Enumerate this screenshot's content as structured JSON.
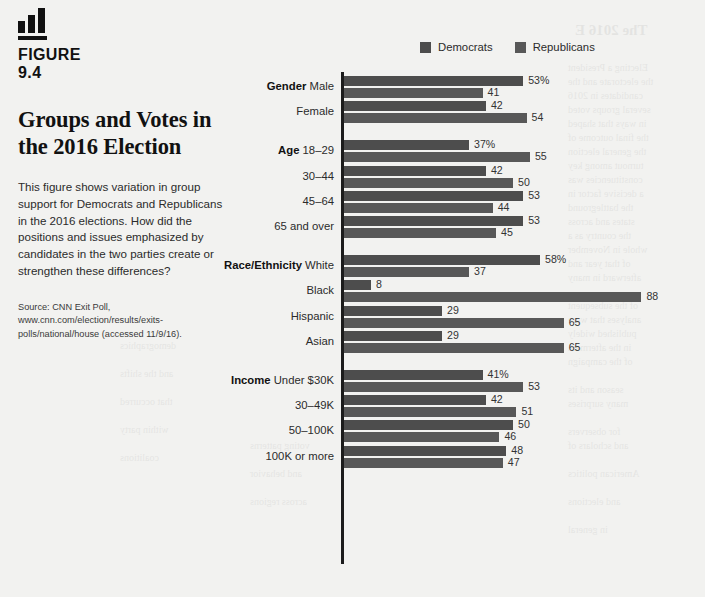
{
  "figure": {
    "icon_name": "bar-chart-icon",
    "label": "FIGURE\n9.4",
    "label_line1": "FIGURE",
    "label_line2": "9.4",
    "title": "Groups and Votes in the 2016 Election",
    "description": "This figure shows variation in group support for Democrats and Republicans in the 2016 elections. How did the positions and issues emphasized by candidates in the two parties create or strengthen these differences?",
    "source": "Source: CNN Exit Poll, www.cnn.com/election/results/exits-polls/national/house (accessed 11/9/16)."
  },
  "legend": {
    "position": "top-right",
    "items": [
      {
        "label": "Democrats",
        "color": "#4d4d4d",
        "swatch_name": "democrats-swatch"
      },
      {
        "label": "Republicans",
        "color": "#585858",
        "swatch_name": "republicans-swatch"
      }
    ]
  },
  "chart_data": {
    "type": "bar",
    "orientation": "horizontal",
    "title": "Groups and Votes in the 2016 Election",
    "xlabel": "",
    "ylabel": "",
    "xlim": [
      0,
      88
    ],
    "grid": false,
    "legend_position": "top-right",
    "value_unit": "percent",
    "first_value_suffix": "%",
    "series": [
      {
        "name": "Democrats",
        "color": "#4d4d4d"
      },
      {
        "name": "Republicans",
        "color": "#585858"
      }
    ],
    "groups": [
      {
        "group": "Gender",
        "rows": [
          {
            "category": "Male",
            "democrats": 53,
            "republicans": 41,
            "dem_label": "53%",
            "rep_label": "41"
          },
          {
            "category": "Female",
            "democrats": 42,
            "republicans": 54,
            "dem_label": "42",
            "rep_label": "54"
          }
        ]
      },
      {
        "group": "Age",
        "rows": [
          {
            "category": "18–29",
            "democrats": 37,
            "republicans": 55,
            "dem_label": "37%",
            "rep_label": "55"
          },
          {
            "category": "30–44",
            "democrats": 42,
            "republicans": 50,
            "dem_label": "42",
            "rep_label": "50"
          },
          {
            "category": "45–64",
            "democrats": 53,
            "republicans": 44,
            "dem_label": "53",
            "rep_label": "44"
          },
          {
            "category": "65 and over",
            "democrats": 53,
            "republicans": 45,
            "dem_label": "53",
            "rep_label": "45"
          }
        ]
      },
      {
        "group": "Race/Ethnicity",
        "rows": [
          {
            "category": "White",
            "democrats": 58,
            "republicans": 37,
            "dem_label": "58%",
            "rep_label": "37"
          },
          {
            "category": "Black",
            "democrats": 8,
            "republicans": 88,
            "dem_label": "8",
            "rep_label": "88"
          },
          {
            "category": "Hispanic",
            "democrats": 29,
            "republicans": 65,
            "dem_label": "29",
            "rep_label": "65"
          },
          {
            "category": "Asian",
            "democrats": 29,
            "republicans": 65,
            "dem_label": "29",
            "rep_label": "65"
          }
        ]
      },
      {
        "group": "Income",
        "rows": [
          {
            "category": "Under $30K",
            "democrats": 41,
            "republicans": 53,
            "dem_label": "41%",
            "rep_label": "53"
          },
          {
            "category": "30–49K",
            "democrats": 42,
            "republicans": 51,
            "dem_label": "42",
            "rep_label": "51"
          },
          {
            "category": "50–100K",
            "democrats": 50,
            "republicans": 46,
            "dem_label": "50",
            "rep_label": "46"
          },
          {
            "category": "100K or more",
            "democrats": 48,
            "republicans": 47,
            "dem_label": "48",
            "rep_label": "47"
          }
        ]
      }
    ]
  },
  "bleed_text": [
    {
      "text": "The 2016 E",
      "x": 575,
      "y": 22,
      "size": 15,
      "bold": true
    },
    {
      "text": "Electing a President",
      "x": 568,
      "y": 62,
      "size": 10
    },
    {
      "text": "the electorate and the",
      "x": 568,
      "y": 76,
      "size": 10
    },
    {
      "text": "candidates in 2016",
      "x": 568,
      "y": 90,
      "size": 10
    },
    {
      "text": "several groups voted",
      "x": 568,
      "y": 104,
      "size": 10
    },
    {
      "text": "in ways that shaped",
      "x": 568,
      "y": 118,
      "size": 10
    },
    {
      "text": "the final outcome of",
      "x": 568,
      "y": 132,
      "size": 10
    },
    {
      "text": "the general election",
      "x": 568,
      "y": 146,
      "size": 10
    },
    {
      "text": "turnout among key",
      "x": 568,
      "y": 160,
      "size": 10
    },
    {
      "text": "constituencies was",
      "x": 568,
      "y": 174,
      "size": 10
    },
    {
      "text": "a decisive factor in",
      "x": 568,
      "y": 188,
      "size": 10
    },
    {
      "text": "the battleground",
      "x": 568,
      "y": 202,
      "size": 10
    },
    {
      "text": "states and across",
      "x": 568,
      "y": 216,
      "size": 10
    },
    {
      "text": "the country as a",
      "x": 568,
      "y": 230,
      "size": 10
    },
    {
      "text": "whole in November",
      "x": 568,
      "y": 244,
      "size": 10
    },
    {
      "text": "of that year and",
      "x": 568,
      "y": 258,
      "size": 10
    },
    {
      "text": "afterward in many",
      "x": 568,
      "y": 272,
      "size": 10
    },
    {
      "text": "of the subsequent",
      "x": 568,
      "y": 300,
      "size": 10
    },
    {
      "text": "analyses that were",
      "x": 568,
      "y": 314,
      "size": 10
    },
    {
      "text": "published widely",
      "x": 568,
      "y": 328,
      "size": 10
    },
    {
      "text": "in the aftermath",
      "x": 568,
      "y": 342,
      "size": 10
    },
    {
      "text": "of the campaign",
      "x": 568,
      "y": 356,
      "size": 10
    },
    {
      "text": "season and its",
      "x": 568,
      "y": 384,
      "size": 10
    },
    {
      "text": "many surprises",
      "x": 568,
      "y": 398,
      "size": 10
    },
    {
      "text": "for observers",
      "x": 568,
      "y": 426,
      "size": 10
    },
    {
      "text": "and scholars of",
      "x": 568,
      "y": 440,
      "size": 10
    },
    {
      "text": "American politics",
      "x": 568,
      "y": 468,
      "size": 10
    },
    {
      "text": "and elections",
      "x": 568,
      "y": 496,
      "size": 10
    },
    {
      "text": "in general",
      "x": 568,
      "y": 524,
      "size": 10
    },
    {
      "text": "voting patterns",
      "x": 250,
      "y": 440,
      "size": 10
    },
    {
      "text": "and behavior",
      "x": 250,
      "y": 468,
      "size": 10
    },
    {
      "text": "across regions",
      "x": 250,
      "y": 496,
      "size": 10
    },
    {
      "text": "demographics",
      "x": 120,
      "y": 340,
      "size": 10
    },
    {
      "text": "and the shifts",
      "x": 120,
      "y": 368,
      "size": 10
    },
    {
      "text": "that occurred",
      "x": 120,
      "y": 396,
      "size": 10
    },
    {
      "text": "within party",
      "x": 120,
      "y": 424,
      "size": 10
    },
    {
      "text": "coalitions",
      "x": 120,
      "y": 452,
      "size": 10
    }
  ]
}
